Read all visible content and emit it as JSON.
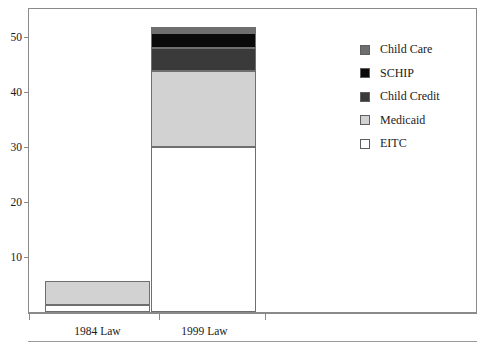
{
  "chart_data": {
    "type": "bar",
    "subtype": "stacked",
    "title": "",
    "xlabel": "",
    "ylabel": "",
    "categories": [
      "1984 Law",
      "1999 Law"
    ],
    "series": [
      {
        "name": "EITC",
        "color": "#ffffff",
        "values": [
          1.3,
          30.0
        ]
      },
      {
        "name": "Medicaid",
        "color": "#d2d2d2",
        "values": [
          4.3,
          13.8
        ]
      },
      {
        "name": "Child Credit",
        "color": "#3a3a3a",
        "values": [
          0.0,
          4.2
        ]
      },
      {
        "name": "SCHIP",
        "color": "#0a0a0a",
        "values": [
          0.0,
          2.8
        ]
      },
      {
        "name": "Child Care",
        "color": "#6e6e6e",
        "values": [
          0.0,
          1.0
        ]
      }
    ],
    "totals": [
      5.6,
      51.8
    ],
    "ylim": [
      0,
      55
    ],
    "yticks": [
      10,
      20,
      30,
      40,
      50
    ],
    "ytick_labels": [
      "10",
      "20",
      "30",
      "40",
      "50"
    ],
    "grid": false,
    "legend_position": "right",
    "legend_order": [
      "Child Care",
      "SCHIP",
      "Child Credit",
      "Medicaid",
      "EITC"
    ]
  },
  "axis": {
    "ticks": [
      {
        "label": "10",
        "value": 10
      },
      {
        "label": "20",
        "value": 20
      },
      {
        "label": "30",
        "value": 30
      },
      {
        "label": "40",
        "value": 40
      },
      {
        "label": "50",
        "value": 50
      }
    ]
  },
  "categories": [
    {
      "label": "1984 Law"
    },
    {
      "label": "1999 Law"
    }
  ],
  "legend": {
    "items": [
      {
        "label": "Child Care",
        "color": "#6e6e6e"
      },
      {
        "label": "SCHIP",
        "color": "#0a0a0a"
      },
      {
        "label": "Child Credit",
        "color": "#3a3a3a"
      },
      {
        "label": "Medicaid",
        "color": "#d2d2d2"
      },
      {
        "label": "EITC",
        "color": "#ffffff"
      }
    ]
  }
}
